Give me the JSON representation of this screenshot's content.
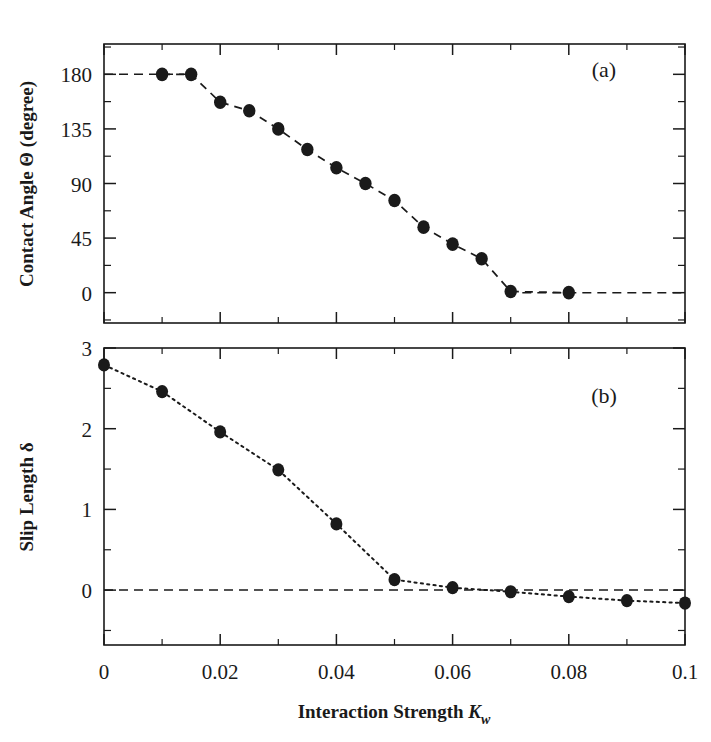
{
  "figure": {
    "width": 711,
    "height": 742,
    "background": "#ffffff",
    "ink_color": "#1a1a1a"
  },
  "panel_a": {
    "tag": "(a)",
    "ylabel": "Contact Angle Θ (degree)",
    "ytick_labels": [
      "180",
      "135",
      "90",
      "45",
      "0"
    ]
  },
  "panel_b": {
    "tag": "(b)",
    "ylabel_prefix": "Slip Length ",
    "ylabel_symbol": "δ",
    "ytick_labels": [
      "3",
      "2",
      "1",
      "0"
    ]
  },
  "xaxis": {
    "label_prefix": "Interaction Strength ",
    "label_symbol": "K",
    "label_subscript": "w",
    "tick_labels": [
      "0",
      "0.02",
      "0.04",
      "0.06",
      "0.08",
      "0.1"
    ]
  },
  "chart_data": [
    {
      "type": "scatter",
      "title": "(a)",
      "xlabel": "Interaction Strength K_w",
      "ylabel": "Contact Angle Θ (degree)",
      "xlim": [
        0,
        0.1
      ],
      "ylim": [
        -25,
        205
      ],
      "xticks": [
        0,
        0.02,
        0.04,
        0.06,
        0.08,
        0.1
      ],
      "xticks_minor": [
        0.01,
        0.03,
        0.05,
        0.07,
        0.09
      ],
      "yticks": [
        0,
        45,
        90,
        135,
        180
      ],
      "yticks_minor": [
        -22.5,
        22.5,
        67.5,
        112.5,
        157.5,
        202.5
      ],
      "grid": false,
      "legend": null,
      "marker": "filled-circle",
      "linestyle": "dashed",
      "series": [
        {
          "name": "contact angle",
          "x": [
            0.01,
            0.015,
            0.02,
            0.025,
            0.03,
            0.035,
            0.04,
            0.045,
            0.05,
            0.055,
            0.06,
            0.065,
            0.07,
            0.08
          ],
          "y": [
            180,
            180,
            157,
            150,
            135,
            118,
            103,
            90,
            76,
            54,
            40,
            28,
            1,
            0
          ]
        }
      ],
      "guide_lines": [
        {
          "name": "plateau-180",
          "x": [
            0.0,
            0.015
          ],
          "y": [
            180,
            180
          ],
          "style": "dashed"
        },
        {
          "name": "plateau-0",
          "x": [
            0.072,
            0.1
          ],
          "y": [
            0,
            0
          ],
          "style": "dashed"
        }
      ]
    },
    {
      "type": "scatter",
      "title": "(b)",
      "xlabel": "Interaction Strength K_w",
      "ylabel": "Slip Length δ",
      "xlim": [
        0,
        0.1
      ],
      "ylim": [
        -0.68,
        3.0
      ],
      "xticks": [
        0,
        0.02,
        0.04,
        0.06,
        0.08,
        0.1
      ],
      "xticks_minor": [
        0.01,
        0.03,
        0.05,
        0.07,
        0.09
      ],
      "yticks": [
        0,
        1,
        2,
        3
      ],
      "yticks_minor": [
        -0.5,
        0.5,
        1.5,
        2.5
      ],
      "grid": false,
      "legend": null,
      "marker": "filled-circle",
      "linestyle": "dotted",
      "series": [
        {
          "name": "slip length",
          "x": [
            0.0,
            0.01,
            0.02,
            0.03,
            0.04,
            0.05,
            0.06,
            0.07,
            0.08,
            0.09,
            0.1
          ],
          "y": [
            2.79,
            2.46,
            1.96,
            1.49,
            0.82,
            0.13,
            0.03,
            -0.02,
            -0.08,
            -0.13,
            -0.16
          ]
        }
      ],
      "guide_lines": [
        {
          "name": "zero-reference",
          "x": [
            0.0,
            0.1
          ],
          "y": [
            0,
            0
          ],
          "style": "dashed"
        }
      ]
    }
  ]
}
